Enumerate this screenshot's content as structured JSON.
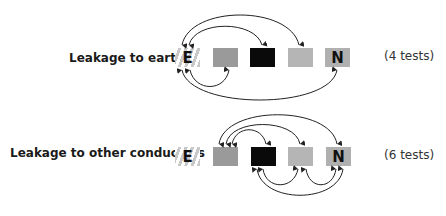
{
  "rows": [
    {
      "label": "Leakage to earth",
      "count": "(4 tests)",
      "conductors": [
        {
          "id": "E",
          "letter": "E",
          "fill": "hatched"
        },
        {
          "id": "c2",
          "letter": "",
          "fill": "#9a9a9a"
        },
        {
          "id": "c3",
          "letter": "",
          "fill": "#0a0a0a"
        },
        {
          "id": "c4",
          "letter": "",
          "fill": "#b5b5b5"
        },
        {
          "id": "N",
          "letter": "N",
          "fill": "#b0b0b0"
        }
      ],
      "tests": [
        [
          "E",
          "c2"
        ],
        [
          "E",
          "c3"
        ],
        [
          "E",
          "c4"
        ],
        [
          "E",
          "N"
        ]
      ]
    },
    {
      "label": "Leakage to other conductors",
      "count": "(6 tests)",
      "conductors": [
        {
          "id": "E",
          "letter": "E",
          "fill": "hatched"
        },
        {
          "id": "c2",
          "letter": "",
          "fill": "#9a9a9a"
        },
        {
          "id": "c3",
          "letter": "",
          "fill": "#0a0a0a"
        },
        {
          "id": "c4",
          "letter": "",
          "fill": "#b5b5b5"
        },
        {
          "id": "N",
          "letter": "N",
          "fill": "#b0b0b0"
        }
      ],
      "tests": [
        [
          "c2",
          "c3"
        ],
        [
          "c2",
          "c4"
        ],
        [
          "c2",
          "N"
        ],
        [
          "c3",
          "c4"
        ],
        [
          "c4",
          "N"
        ],
        [
          "c3",
          "N"
        ]
      ]
    }
  ],
  "colors": {
    "arc": "#222222",
    "earth_stripe": "#c8c8c8"
  }
}
